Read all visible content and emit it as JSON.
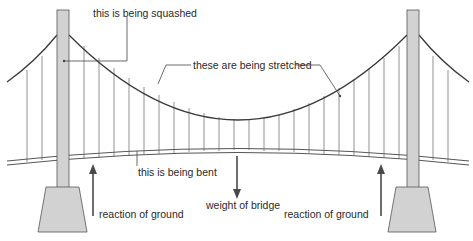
{
  "colors": {
    "tower_fill": "#d2d2d2",
    "tower_stroke": "#555555",
    "cable": "#3a3a3a",
    "hanger": "#6a6a6a",
    "deck": "#555555",
    "arrow": "#4a4a4a",
    "text": "#2a2a2a"
  },
  "labels": {
    "tower": "this is being squashed",
    "cables": "these are being stretched",
    "deck": "this is being bent",
    "weight": "weight of bridge",
    "reaction_left": "reaction of ground",
    "reaction_right": "reaction of ground"
  },
  "arrows": [
    {
      "name": "reaction-left",
      "direction": "up"
    },
    {
      "name": "weight",
      "direction": "down"
    },
    {
      "name": "reaction-right",
      "direction": "up"
    }
  ]
}
